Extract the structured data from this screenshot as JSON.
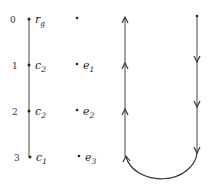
{
  "left_diagram": {
    "rows": [
      {
        "index": "0",
        "label": "r",
        "sub": "g",
        "right_label": "",
        "right_sub": ""
      },
      {
        "index": "1",
        "label": "c",
        "sub": "2",
        "right_label": "e",
        "right_sub": "1"
      },
      {
        "index": "2",
        "label": "c",
        "sub": "2",
        "right_label": "e",
        "right_sub": "2"
      },
      {
        "index": "3",
        "label": "c",
        "sub": "1",
        "right_label": "e",
        "right_sub": "3"
      }
    ]
  },
  "right_diagram": {
    "description": "Directed loop: down the right line, around the bottom arc, up the left line",
    "arrows_left_up": 3,
    "arrows_right_down": 3
  },
  "colors": {
    "line": "#555555",
    "text": "#222222"
  }
}
